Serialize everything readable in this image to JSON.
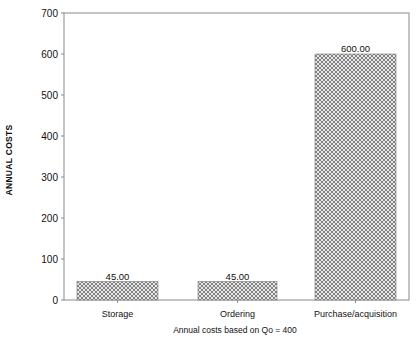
{
  "chart_data": {
    "type": "bar",
    "title": "",
    "xlabel": "Annual costs based on Qo = 400",
    "ylabel": "ANNUAL COSTS",
    "categories": [
      "Storage",
      "Ordering",
      "Purchase/acquisition"
    ],
    "values": [
      45,
      45,
      600
    ],
    "value_labels": [
      "45.00",
      "45.00",
      "600.00"
    ],
    "ylim": [
      0,
      700
    ],
    "yticks": [
      0,
      100,
      200,
      300,
      400,
      500,
      600,
      700
    ],
    "grid": false,
    "legend": null,
    "bar_fill": "crosshatch",
    "colors": {
      "bar_hatch": "#6a6a6a",
      "bar_background": "#e8e8e8",
      "axis": "#888888"
    }
  }
}
